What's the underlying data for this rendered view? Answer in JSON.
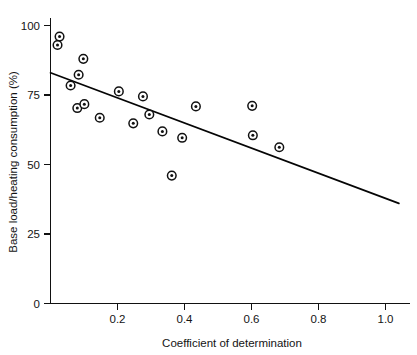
{
  "chart_data": {
    "type": "scatter",
    "title": "",
    "xlabel": "Coefficient of determination",
    "ylabel": "Base load/heating consumption (%)",
    "xlim": [
      0.0,
      1.04
    ],
    "ylim": [
      0,
      104
    ],
    "xticks": [
      0.2,
      0.4,
      0.6,
      0.8,
      1.0
    ],
    "xticklabels": [
      "0.2",
      "0.4",
      "0.6",
      "0.8",
      "1.0"
    ],
    "yticks": [
      0,
      25,
      50,
      75,
      100
    ],
    "yticklabels": [
      "0",
      "25",
      "50",
      "75",
      "100"
    ],
    "grid": false,
    "legend": null,
    "marker": "circle-with-dot",
    "marker_color": "#111111",
    "points": [
      {
        "x": 0.027,
        "y": 96.0
      },
      {
        "x": 0.021,
        "y": 93.0
      },
      {
        "x": 0.098,
        "y": 88.0
      },
      {
        "x": 0.084,
        "y": 82.3
      },
      {
        "x": 0.06,
        "y": 78.4
      },
      {
        "x": 0.08,
        "y": 70.3
      },
      {
        "x": 0.101,
        "y": 71.7
      },
      {
        "x": 0.147,
        "y": 66.8
      },
      {
        "x": 0.204,
        "y": 76.3
      },
      {
        "x": 0.276,
        "y": 74.5
      },
      {
        "x": 0.295,
        "y": 68.0
      },
      {
        "x": 0.247,
        "y": 64.8
      },
      {
        "x": 0.334,
        "y": 61.9
      },
      {
        "x": 0.393,
        "y": 59.6
      },
      {
        "x": 0.434,
        "y": 70.9
      },
      {
        "x": 0.362,
        "y": 46.0
      },
      {
        "x": 0.602,
        "y": 71.1
      },
      {
        "x": 0.604,
        "y": 60.5
      },
      {
        "x": 0.683,
        "y": 56.2
      }
    ],
    "trend_line": {
      "type": "linear-fit",
      "x_start": 0.0,
      "y_start": 83.0,
      "x_end": 1.04,
      "y_end": 36.0
    }
  }
}
